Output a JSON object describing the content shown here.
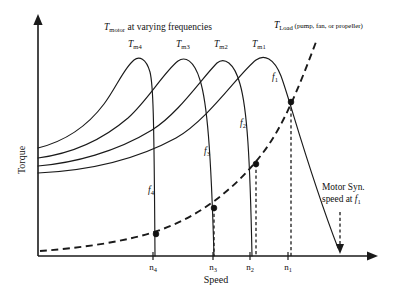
{
  "figure": {
    "title_motor": "T",
    "title_motor_sub": "motor",
    "title_motor_rest": " at varying frequencies",
    "title_load": "T",
    "title_load_sub": "Load",
    "title_load_rest": " (pump, fan, or propeller)",
    "x_axis_label": "Speed",
    "y_axis_label": "Torque",
    "annotation_line1": "Motor Syn.",
    "annotation_line2": "speed at ",
    "annotation_line2_italic": "f",
    "annotation_line2_sub": "1",
    "ink_color": "#111111"
  },
  "curve_labels": [
    {
      "base": "T",
      "sub": "m4",
      "x": 128,
      "y": 47
    },
    {
      "base": "T",
      "sub": "m3",
      "x": 176,
      "y": 47
    },
    {
      "base": "T",
      "sub": "m2",
      "x": 214,
      "y": 47
    },
    {
      "base": "T",
      "sub": "m1",
      "x": 252,
      "y": 47
    }
  ],
  "freq_labels": [
    {
      "base": "f",
      "sub": "4",
      "x": 148,
      "y": 193
    },
    {
      "base": "f",
      "sub": "3",
      "x": 204,
      "y": 154
    },
    {
      "base": "f",
      "sub": "2",
      "x": 240,
      "y": 126
    },
    {
      "base": "f",
      "sub": "1",
      "x": 272,
      "y": 80
    }
  ],
  "tick_labels": [
    {
      "base": "n",
      "sub": "4",
      "x": 153
    },
    {
      "base": "n",
      "sub": "3",
      "x": 213
    },
    {
      "base": "n",
      "sub": "2",
      "x": 250
    },
    {
      "base": "n",
      "sub": "1",
      "x": 288
    }
  ],
  "chart_data": {
    "type": "line",
    "xlabel": "Speed",
    "ylabel": "Torque",
    "xlim": [
      0,
      397
    ],
    "ylim": [
      0,
      303
    ],
    "grid": false,
    "legend": "inline-annotations",
    "axes": {
      "origin_x": 38,
      "origin_y": 256,
      "x_arrow_end": 378,
      "y_arrow_end": 14
    },
    "series": [
      {
        "name": "T_m4",
        "label": "T_m4",
        "style": "solid",
        "peak": {
          "x": 140,
          "y": 58
        },
        "sync_speed_x": 153,
        "path": "M 38 148 C 62 142, 86 128, 104 104 C 116 88, 124 68, 134 60 C 139 56, 146 58, 150 72 C 153 84, 154 108, 155 256"
      },
      {
        "name": "T_m3",
        "label": "T_m3",
        "style": "solid",
        "peak": {
          "x": 186,
          "y": 58
        },
        "sync_speed_x": 213,
        "path": "M 38 158 C 68 154, 100 142, 128 118 C 148 100, 164 72, 178 61 C 185 56, 194 60, 200 80 C 207 102, 211 150, 214 256"
      },
      {
        "name": "T_m2",
        "label": "T_m2",
        "style": "solid",
        "peak": {
          "x": 224,
          "y": 60
        },
        "sync_speed_x": 250,
        "path": "M 38 166 C 74 163, 116 152, 152 130 C 178 114, 202 78, 217 63 C 224 57, 234 62, 240 84 C 247 108, 250 156, 252 256"
      },
      {
        "name": "T_m1",
        "label": "T_m1",
        "style": "solid",
        "peak": {
          "x": 262,
          "y": 57
        },
        "sync_speed_x": 340,
        "path": "M 38 173 C 82 171, 132 162, 176 138 C 208 120, 240 72, 256 60 C 264 54, 274 58, 281 76 C 290 100, 308 170, 338 248"
      },
      {
        "name": "T_Load",
        "label": "T_Load (pump, fan, or propeller)",
        "style": "dashed",
        "path": "M 40 251 C 80 248, 126 242, 160 230 C 200 216, 236 188, 262 154 C 284 126, 300 84, 316 42"
      }
    ],
    "operating_points": [
      {
        "label": "n4",
        "x": 156,
        "y": 234,
        "drop_line": false
      },
      {
        "label": "n3",
        "x": 214,
        "y": 208,
        "drop_line": true
      },
      {
        "label": "n2",
        "x": 256,
        "y": 164,
        "drop_line": true
      },
      {
        "label": "n1",
        "x": 291,
        "y": 102,
        "drop_line": true
      }
    ],
    "sync_speed_marker": {
      "label": "Motor Syn. speed at f1",
      "x": 340,
      "y_top": 212,
      "y_bottom": 252
    }
  }
}
